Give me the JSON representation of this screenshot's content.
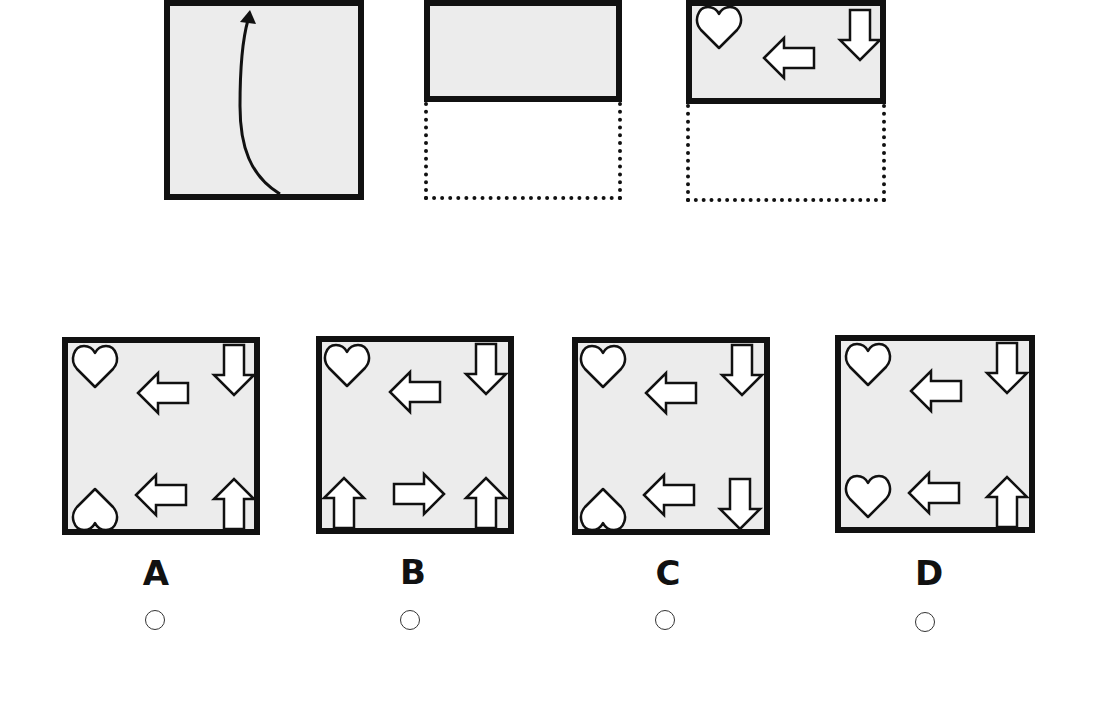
{
  "question": {
    "steps": [
      {
        "id": "step-1",
        "description": "Square paper with curved arrow indicating fold from bottom up"
      },
      {
        "id": "step-2",
        "description": "Paper folded in half, bottom half shown as dotted outline"
      },
      {
        "id": "step-3",
        "description": "Folded paper with shapes: heart top-left, left arrow center, down arrow top-right"
      }
    ],
    "folded_shapes": [
      "heart",
      "arrow-left",
      "arrow-down"
    ]
  },
  "options": [
    {
      "letter": "A",
      "shapes": {
        "top_left": "heart",
        "top_center": "arrow-left",
        "top_right": "arrow-down",
        "bottom_left": "heart-inverted",
        "bottom_center": "arrow-left",
        "bottom_right": "arrow-up"
      }
    },
    {
      "letter": "B",
      "shapes": {
        "top_left": "heart",
        "top_center": "arrow-left",
        "top_right": "arrow-down",
        "bottom_left": "arrow-up",
        "bottom_center": "arrow-right",
        "bottom_right": "arrow-up"
      }
    },
    {
      "letter": "C",
      "shapes": {
        "top_left": "heart",
        "top_center": "arrow-left",
        "top_right": "arrow-down",
        "bottom_left": "heart-inverted",
        "bottom_center": "arrow-left",
        "bottom_right": "arrow-down"
      }
    },
    {
      "letter": "D",
      "shapes": {
        "top_left": "heart",
        "top_center": "arrow-left",
        "top_right": "arrow-down",
        "bottom_left": "heart",
        "bottom_center": "arrow-left",
        "bottom_right": "arrow-up"
      }
    }
  ],
  "colors": {
    "paper": "#ececec",
    "border": "#111111",
    "shape_fill": "#ffffff"
  }
}
